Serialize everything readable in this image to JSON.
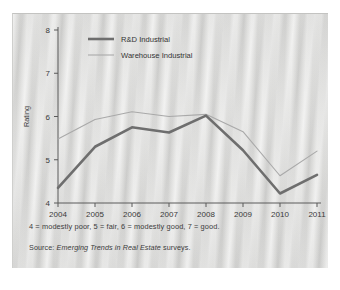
{
  "figure": {
    "caption_note": "4 = modestly poor, 5 = fair, 6 = modestly good, 7 = good.",
    "source_prefix": "Source: ",
    "source_title": "Emerging Trends in Real Estate",
    "source_suffix": " surveys."
  },
  "chart_data": {
    "type": "line",
    "title": "",
    "xlabel": "",
    "ylabel": "Rating",
    "categories": [
      "2004",
      "2005",
      "2006",
      "2007",
      "2008",
      "2009",
      "2010",
      "2011"
    ],
    "x": [
      2004,
      2005,
      2006,
      2007,
      2008,
      2009,
      2010,
      2011
    ],
    "ylim": [
      4,
      8
    ],
    "yticks": [
      "4",
      "5",
      "6",
      "7",
      "8"
    ],
    "ytick_values": [
      4,
      5,
      6,
      7,
      8
    ],
    "xlim": [
      2004,
      2011
    ],
    "grid": false,
    "legend_position": "top-left-inside",
    "series": [
      {
        "name": "R&D Industrial",
        "color": "#6e6e6e",
        "width": 2.6,
        "values": [
          4.35,
          5.3,
          5.75,
          5.63,
          6.02,
          5.22,
          4.22,
          4.65
        ]
      },
      {
        "name": "Warehouse Industrial",
        "color": "#a9a9a9",
        "width": 1.1,
        "values": [
          5.48,
          5.93,
          6.11,
          6.0,
          6.05,
          5.65,
          4.63,
          5.2
        ]
      }
    ]
  }
}
